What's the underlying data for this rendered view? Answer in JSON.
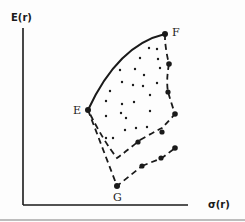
{
  "diagram": {
    "axes": {
      "y_label": "E(r)",
      "x_label": "σ(r)"
    },
    "points": {
      "E": "E",
      "F": "F",
      "G": "G"
    },
    "colors": {
      "ink": "#1a1a1a",
      "background": "#fdfdfd"
    }
  }
}
